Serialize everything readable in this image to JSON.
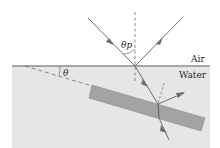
{
  "diagram": {
    "labels": {
      "air": "Air",
      "water": "Water",
      "brewster_angle": "θp",
      "tilt_angle": "θ"
    },
    "colors": {
      "water": "#e6e6e6",
      "surface_line": "#8c8c8c",
      "slab": "#a3a3a3",
      "slab_edge": "#8a8a8a",
      "ray": "#6e6e6e",
      "dashed": "#6e6e6e",
      "text": "#2a2a2a"
    },
    "elements": [
      "incident-ray",
      "reflected-ray",
      "refracted-ray",
      "normal-line",
      "water-surface",
      "slab",
      "slab-extension-dashed",
      "slab-normal-dashed",
      "slab-reflected-ray",
      "transmitted-ray"
    ]
  }
}
